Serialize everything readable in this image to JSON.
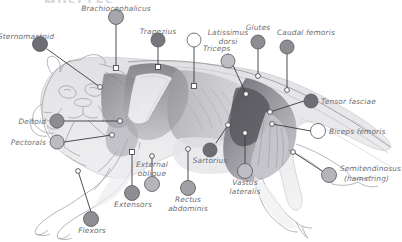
{
  "figure": {
    "title_cutoff": "MUSCLES",
    "colors": {
      "label_text": "#6e6e73",
      "leader_line": "#3b3b40",
      "marker_dark": "#6b6b70",
      "marker_mid": "#8e8e93",
      "marker_light": "#b8b8bd",
      "marker_open": "#ffffff",
      "illustration_ink": "#8a8a8f",
      "background": "#ffffff"
    }
  },
  "callouts": [
    {
      "label": "Brachiocephalicus",
      "marker": "mid",
      "lines": [
        "Brachiocephalicus"
      ]
    },
    {
      "label": "Sternomastoid",
      "marker": "dark",
      "lines": [
        "Sternomastoid"
      ]
    },
    {
      "label": "Trapezius",
      "marker": "dark",
      "lines": [
        "Trapezius"
      ]
    },
    {
      "label": "Triceps",
      "marker": "open",
      "lines": [
        "Triceps"
      ]
    },
    {
      "label": "Latissimus dorsi",
      "marker": "light",
      "lines": [
        "Latissimus",
        "dorsi"
      ]
    },
    {
      "label": "Glutes",
      "marker": "mid",
      "lines": [
        "Glutes"
      ]
    },
    {
      "label": "Caudal femoris",
      "marker": "mid",
      "lines": [
        "Caudal femoris"
      ]
    },
    {
      "label": "Tensor fasciae",
      "marker": "dark",
      "lines": [
        "Tensor fasciae"
      ]
    },
    {
      "label": "Biceps femoris",
      "marker": "open",
      "lines": [
        "Biceps femoris"
      ]
    },
    {
      "label": "Semitendinosus",
      "marker": "light",
      "lines": [
        "Semitendinosus",
        "(hamstring)"
      ]
    },
    {
      "label": "Deltoid",
      "marker": "mid",
      "lines": [
        "Deltoid"
      ]
    },
    {
      "label": "Pectorals",
      "marker": "light",
      "lines": [
        "Pectorals"
      ]
    },
    {
      "label": "External oblique",
      "marker": "light",
      "lines": [
        "External",
        "oblique"
      ]
    },
    {
      "label": "Sartorius",
      "marker": "dark",
      "lines": [
        "Sartorius"
      ]
    },
    {
      "label": "Vastus lateralis",
      "marker": "light",
      "lines": [
        "Vastus",
        "lateralis"
      ]
    },
    {
      "label": "Rectus abdominis",
      "marker": "mid",
      "lines": [
        "Rectus",
        "abdominis"
      ]
    },
    {
      "label": "Extensors",
      "marker": "mid",
      "lines": [
        "Extensors"
      ]
    },
    {
      "label": "Flexors",
      "marker": "mid",
      "lines": [
        "Flexors"
      ]
    }
  ],
  "labels": {
    "brachiocephalicus": "Brachiocephalicus",
    "sternomastoid": "Sternomastoid",
    "trapezius": "Trapezius",
    "triceps": "Triceps",
    "latissimus_1": "Latissimus",
    "latissimus_2": "dorsi",
    "glutes": "Glutes",
    "caudal_femoris": "Caudal femoris",
    "tensor_fasciae": "Tensor fasciae",
    "biceps_femoris": "Biceps femoris",
    "semitendinosus_1": "Semitendinosus",
    "semitendinosus_2": "(hamstring)",
    "deltoid": "Deltoid",
    "pectorals": "Pectorals",
    "external_1": "External",
    "external_2": "oblique",
    "sartorius": "Sartorius",
    "vastus_1": "Vastus",
    "vastus_2": "lateralis",
    "rectus_1": "Rectus",
    "rectus_2": "abdominis",
    "extensors": "Extensors",
    "flexors": "Flexors"
  }
}
